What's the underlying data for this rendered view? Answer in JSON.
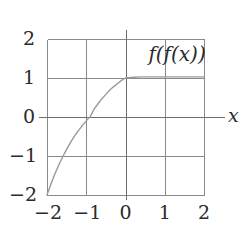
{
  "figure": {
    "background_color": "#ffffff",
    "plot_box": {
      "left": 47,
      "top": 39,
      "right": 204,
      "bottom": 195
    },
    "grid_color": "#8a8a8a",
    "axis_color": "#6f6f6f",
    "curve_color": "#9a9a9a",
    "text_color": "#2b2b2b"
  },
  "chart_data": {
    "type": "line",
    "title": "",
    "subtitle": "",
    "xlabel": "x",
    "ylabel": "",
    "xlim": [
      -2,
      2
    ],
    "ylim": [
      -2,
      2
    ],
    "grid": true,
    "legend_position": "inside-top-right",
    "xticks": [
      -2,
      -1,
      0,
      1,
      2
    ],
    "xtick_labels": [
      "−2",
      "−1",
      "0",
      "1",
      "2"
    ],
    "yticks": [
      -2,
      -1,
      0,
      1,
      2
    ],
    "ytick_labels": [
      "2",
      "1",
      "0",
      "−1",
      "−2"
    ],
    "annotations": [
      {
        "name": "series-label",
        "text": "f(f(x))",
        "x": 1.45,
        "y": 1.62
      }
    ],
    "series": [
      {
        "name": "f(f(x))",
        "color": "#9a9a9a",
        "x": [
          -2.0,
          -1.9,
          -1.8,
          -1.7,
          -1.6,
          -1.5,
          -1.4,
          -1.3,
          -1.2,
          -1.1,
          -1.0,
          -0.9,
          -0.8,
          -0.7,
          -0.6,
          -0.5,
          -0.4,
          -0.3,
          -0.2,
          -0.1,
          0.0,
          0.2,
          0.4,
          0.6,
          0.8,
          1.0,
          1.2,
          1.4,
          1.6,
          1.8,
          2.0
        ],
        "y": [
          -2.0,
          -1.72,
          -1.46,
          -1.23,
          -1.02,
          -0.83,
          -0.65,
          -0.49,
          -0.35,
          -0.22,
          -0.1,
          0.01,
          0.2,
          0.34,
          0.47,
          0.58,
          0.69,
          0.78,
          0.86,
          0.94,
          1.0,
          1.02,
          1.03,
          1.03,
          1.03,
          1.03,
          1.03,
          1.03,
          1.03,
          1.03,
          1.03
        ]
      }
    ]
  },
  "labels": {
    "x_axis_name": "x",
    "series_label": "f(f(x))"
  }
}
